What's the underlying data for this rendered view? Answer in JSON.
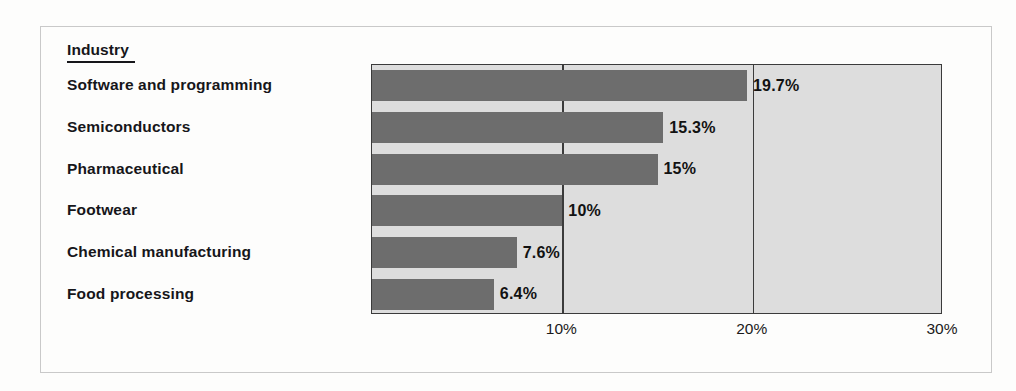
{
  "chart_data": {
    "type": "bar",
    "orientation": "horizontal",
    "title": "",
    "xlabel": "",
    "ylabel": "Industry",
    "legend": null,
    "grid": true,
    "xlim": [
      0,
      30
    ],
    "xticks": [
      "10%",
      "20%",
      "30%"
    ],
    "xtick_values": [
      10,
      20,
      30
    ],
    "categories": [
      "Software and programming",
      "Semiconductors",
      "Pharmaceutical",
      "Footwear",
      "Chemical manufacturing",
      "Food processing"
    ],
    "values": [
      19.7,
      15.3,
      15,
      10,
      7.6,
      6.4
    ],
    "value_labels": [
      "19.7%",
      "15.3%",
      "15%",
      "10%",
      "7.6%",
      "6.4%"
    ],
    "colors": {
      "bar": "#6d6d6d",
      "plot_background": "#dddddd",
      "axis": "#3b3b3b",
      "text": "#16161a",
      "frame": "#c9c9c9"
    }
  },
  "heading": {
    "label": "Industry"
  },
  "ghost_text": {
    "top": "",
    "mid": "",
    "bottom": ""
  }
}
